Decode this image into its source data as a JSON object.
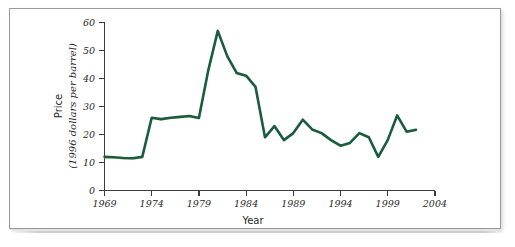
{
  "figure": {
    "background_color": "#ffffff",
    "frame_color": "#9a9a9a",
    "series_color": "#1a5c3f",
    "series_highlight_color": "#b9c94a",
    "axis_color": "#3b3b3b"
  },
  "chart_data": {
    "type": "line",
    "title": "",
    "xlabel": "Year",
    "ylabel_line1": "Price",
    "ylabel_line2": "(1996 dollars per barrel)",
    "xlim": [
      1969,
      2004
    ],
    "ylim": [
      0,
      60
    ],
    "grid": false,
    "legend": "none",
    "xticks": [
      1969,
      1974,
      1979,
      1984,
      1989,
      1994,
      1999,
      2004
    ],
    "xtick_labels": [
      "1969",
      "1974",
      "1979",
      "1984",
      "1989",
      "1994",
      "1999",
      "2004"
    ],
    "yticks": [
      0,
      10,
      20,
      30,
      40,
      50,
      60
    ],
    "ytick_labels": [
      "0",
      "10",
      "20",
      "30",
      "40",
      "50",
      "60"
    ],
    "series": [
      {
        "name": "Oil price (1996 dollars per barrel)",
        "color": "#1a5c3f",
        "x": [
          1969,
          1970,
          1971,
          1972,
          1973,
          1974,
          1975,
          1976,
          1977,
          1978,
          1979,
          1980,
          1981,
          1982,
          1983,
          1984,
          1985,
          1986,
          1987,
          1988,
          1989,
          1990,
          1991,
          1992,
          1993,
          1994,
          1995,
          1996,
          1997,
          1998,
          1999,
          2000,
          2001,
          2002
        ],
        "values": [
          12.0,
          11.9,
          11.6,
          11.5,
          12.0,
          26.0,
          25.5,
          26.0,
          26.3,
          26.6,
          25.9,
          43.0,
          57.0,
          48.0,
          42.0,
          41.0,
          37.0,
          19.0,
          23.0,
          18.0,
          20.5,
          25.3,
          21.8,
          20.5,
          18.0,
          16.0,
          17.0,
          20.5,
          19.0,
          12.0,
          18.0,
          26.8,
          21.0,
          21.7
        ]
      }
    ]
  }
}
